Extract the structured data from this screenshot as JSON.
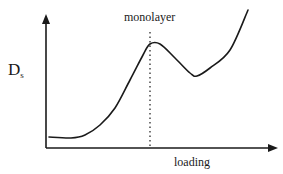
{
  "chart_data": {
    "type": "line",
    "title": "",
    "xlabel": "loading",
    "ylabel_main": "D",
    "ylabel_sub": "s",
    "annotation": "monolayer",
    "axis_ticks": "none",
    "grid": false,
    "legend": "none",
    "series": [
      {
        "name": "Ds vs loading",
        "points_px": [
          [
            49,
            137
          ],
          [
            71,
            138
          ],
          [
            85,
            135
          ],
          [
            100,
            125
          ],
          [
            115,
            108
          ],
          [
            130,
            80
          ],
          [
            143,
            55
          ],
          [
            150,
            44
          ],
          [
            160,
            44
          ],
          [
            175,
            58
          ],
          [
            190,
            73
          ],
          [
            197,
            76
          ],
          [
            210,
            68
          ],
          [
            230,
            50
          ],
          [
            248,
            10
          ]
        ]
      }
    ],
    "monolayer_marker_x_px": 150,
    "colors": {
      "line": "#1a1a1a",
      "axis": "#1a1a1a",
      "background": "#ffffff"
    }
  },
  "labels": {
    "y_main": "D",
    "y_sub": "s",
    "monolayer": "monolayer",
    "x": "loading"
  }
}
